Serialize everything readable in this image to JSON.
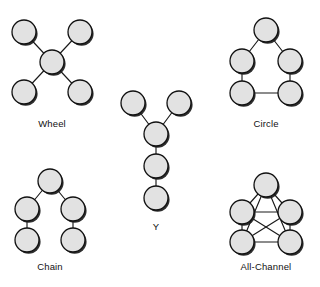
{
  "figure": {
    "background_color": "#ffffff",
    "node_fill": "#e2e2e2",
    "node_stroke": "#111111",
    "edge_color": "#1a1a1a",
    "label_color": "#111111",
    "node_radius": 12
  },
  "networks": [
    {
      "id": "wheel",
      "label": "Wheel",
      "label_pos": {
        "x": 52,
        "y": 127
      },
      "nodes": [
        {
          "id": "w-top-left",
          "x": 24,
          "y": 32
        },
        {
          "id": "w-top-right",
          "x": 80,
          "y": 32
        },
        {
          "id": "w-center",
          "x": 52,
          "y": 62
        },
        {
          "id": "w-bottom-left",
          "x": 24,
          "y": 92
        },
        {
          "id": "w-bottom-right",
          "x": 80,
          "y": 92
        }
      ],
      "edges": [
        [
          "w-center",
          "w-top-left"
        ],
        [
          "w-center",
          "w-top-right"
        ],
        [
          "w-center",
          "w-bottom-left"
        ],
        [
          "w-center",
          "w-bottom-right"
        ]
      ]
    },
    {
      "id": "circle",
      "label": "Circle",
      "label_pos": {
        "x": 266,
        "y": 127
      },
      "nodes": [
        {
          "id": "c-apex",
          "x": 266,
          "y": 30
        },
        {
          "id": "c-mid-left",
          "x": 242,
          "y": 61
        },
        {
          "id": "c-mid-right",
          "x": 290,
          "y": 61
        },
        {
          "id": "c-bottom-left",
          "x": 242,
          "y": 93
        },
        {
          "id": "c-bottom-right",
          "x": 290,
          "y": 93
        }
      ],
      "edges": [
        [
          "c-apex",
          "c-mid-left"
        ],
        [
          "c-apex",
          "c-mid-right"
        ],
        [
          "c-mid-left",
          "c-bottom-left"
        ],
        [
          "c-mid-right",
          "c-bottom-right"
        ],
        [
          "c-bottom-left",
          "c-bottom-right"
        ]
      ]
    },
    {
      "id": "y",
      "label": "Y",
      "label_pos": {
        "x": 156,
        "y": 230
      },
      "nodes": [
        {
          "id": "y-top-left",
          "x": 133,
          "y": 103
        },
        {
          "id": "y-top-right",
          "x": 179,
          "y": 103
        },
        {
          "id": "y-junction",
          "x": 156,
          "y": 134
        },
        {
          "id": "y-middle",
          "x": 156,
          "y": 166
        },
        {
          "id": "y-bottom",
          "x": 156,
          "y": 198
        }
      ],
      "edges": [
        [
          "y-top-left",
          "y-junction"
        ],
        [
          "y-top-right",
          "y-junction"
        ],
        [
          "y-junction",
          "y-middle"
        ],
        [
          "y-middle",
          "y-bottom"
        ]
      ]
    },
    {
      "id": "chain",
      "label": "Chain",
      "label_pos": {
        "x": 50,
        "y": 270
      },
      "nodes": [
        {
          "id": "ch-top",
          "x": 50,
          "y": 181
        },
        {
          "id": "ch-mid-left",
          "x": 27,
          "y": 209
        },
        {
          "id": "ch-mid-right",
          "x": 73,
          "y": 209
        },
        {
          "id": "ch-bottom-left",
          "x": 27,
          "y": 240
        },
        {
          "id": "ch-bottom-right",
          "x": 73,
          "y": 240
        }
      ],
      "edges": [
        [
          "ch-top",
          "ch-mid-left"
        ],
        [
          "ch-top",
          "ch-mid-right"
        ],
        [
          "ch-mid-left",
          "ch-bottom-left"
        ],
        [
          "ch-mid-right",
          "ch-bottom-right"
        ]
      ]
    },
    {
      "id": "all-channel",
      "label": "All-Channel",
      "label_pos": {
        "x": 266,
        "y": 270
      },
      "nodes": [
        {
          "id": "a-apex",
          "x": 266,
          "y": 185
        },
        {
          "id": "a-mid-left",
          "x": 242,
          "y": 212
        },
        {
          "id": "a-mid-right",
          "x": 290,
          "y": 212
        },
        {
          "id": "a-bottom-left",
          "x": 242,
          "y": 242
        },
        {
          "id": "a-bottom-right",
          "x": 290,
          "y": 242
        }
      ],
      "edges": [
        [
          "a-apex",
          "a-mid-left"
        ],
        [
          "a-apex",
          "a-mid-right"
        ],
        [
          "a-apex",
          "a-bottom-left"
        ],
        [
          "a-apex",
          "a-bottom-right"
        ],
        [
          "a-mid-left",
          "a-mid-right"
        ],
        [
          "a-mid-left",
          "a-bottom-left"
        ],
        [
          "a-mid-left",
          "a-bottom-right"
        ],
        [
          "a-mid-right",
          "a-bottom-left"
        ],
        [
          "a-mid-right",
          "a-bottom-right"
        ],
        [
          "a-bottom-left",
          "a-bottom-right"
        ]
      ]
    }
  ]
}
